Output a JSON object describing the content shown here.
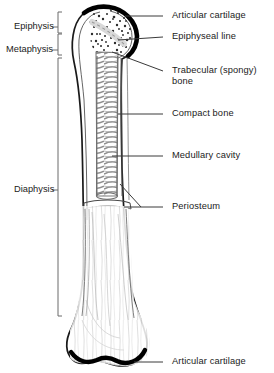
{
  "figure": {
    "view": "longitudinal cut-away section",
    "colors": {
      "outline": "#1a1a1a",
      "cartilage_cap": "#000000",
      "trabecular_stipple": "#2b2b2b",
      "medullary_texture": "#8a8a8a",
      "compact_bone_fill": "#ffffff",
      "leader_line": "#3a3a3a",
      "bracket": "#6b6b6b",
      "text": "#1b1b1b",
      "background": "#ffffff"
    }
  },
  "region_brackets": [
    {
      "id": "epiphysis",
      "label": "Epiphysis",
      "text_x": 14,
      "text_y": 27,
      "bracket_top": 12,
      "bracket_bottom": 33,
      "bracket_x": 58,
      "tick_y": 27
    },
    {
      "id": "metaphysis",
      "label": "Metaphysis",
      "text_x": 6,
      "text_y": 50,
      "bracket_top": 34,
      "bracket_bottom": 55,
      "bracket_x": 58,
      "tick_y": 50
    },
    {
      "id": "diaphysis",
      "label": "Diaphysis",
      "text_x": 14,
      "text_y": 190,
      "bracket_top": 58,
      "bracket_bottom": 316,
      "bracket_x": 58,
      "tick_y": 190
    }
  ],
  "callout_labels": [
    {
      "id": "articular-cartilage-proximal",
      "label": "Articular cartilage",
      "text_x": 172,
      "text_y": 12,
      "leader": {
        "x1": 163,
        "y1": 16,
        "x2": 125,
        "y2": 16
      },
      "target": "proximal articular surface"
    },
    {
      "id": "epiphyseal-line",
      "label": "Epiphyseal line",
      "text_x": 172,
      "text_y": 33,
      "leader": {
        "x1": 163,
        "y1": 37,
        "x2": 118,
        "y2": 40
      },
      "target": "growth plate remnant in epiphysis"
    },
    {
      "id": "trabecular-bone",
      "label": "Trabecular (spongy)",
      "label2": "bone",
      "text_x": 172,
      "text_y": 67,
      "leader": {
        "x1": 163,
        "y1": 71,
        "x2": 112,
        "y2": 52
      },
      "target": "stippled spongy bone in head"
    },
    {
      "id": "compact-bone",
      "label": "Compact bone",
      "text_x": 172,
      "text_y": 110,
      "leader": {
        "x1": 163,
        "y1": 114,
        "x2": 118,
        "y2": 114
      },
      "target": "dense cortical wall of shaft"
    },
    {
      "id": "medullary-cavity",
      "label": "Medullary cavity",
      "text_x": 172,
      "text_y": 152,
      "leader": {
        "x1": 163,
        "y1": 156,
        "x2": 112,
        "y2": 156
      },
      "target": "marrow cavity inside shaft"
    },
    {
      "id": "periosteum",
      "label": "Periosteum",
      "text_x": 172,
      "text_y": 203,
      "leader": {
        "x1": 163,
        "y1": 207,
        "x2": 124,
        "y2": 207
      },
      "leader2": {
        "x1": 140,
        "y1": 207,
        "x2": 120,
        "y2": 184
      },
      "target": "outer fibrous membrane"
    },
    {
      "id": "articular-cartilage-distal",
      "label": "Articular cartilage",
      "text_x": 172,
      "text_y": 358,
      "leader": {
        "x1": 163,
        "y1": 362,
        "x2": 134,
        "y2": 362
      },
      "target": "distal articular surface"
    }
  ]
}
